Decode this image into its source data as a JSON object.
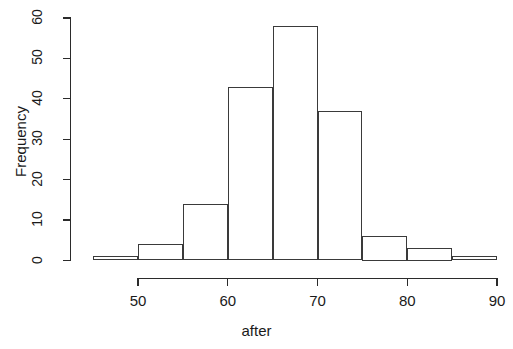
{
  "chart_data": {
    "type": "bar",
    "title": "",
    "xlabel": "after",
    "ylabel": "Frequency",
    "bin_width": 5,
    "bin_edges": [
      45,
      50,
      55,
      60,
      65,
      70,
      75,
      80,
      85,
      90
    ],
    "categories": [
      "45-50",
      "50-55",
      "55-60",
      "60-65",
      "65-70",
      "70-75",
      "75-80",
      "80-85",
      "85-90"
    ],
    "values": [
      1,
      4,
      14,
      43,
      58,
      37,
      6,
      3,
      1
    ],
    "xlim": [
      45,
      90
    ],
    "ylim": [
      0,
      60
    ],
    "xticks": [
      50,
      60,
      70,
      80,
      90
    ],
    "xtick_labels": [
      "50",
      "60",
      "70",
      "80",
      "90"
    ],
    "yticks": [
      0,
      10,
      20,
      30,
      40,
      50,
      60
    ],
    "ytick_labels": [
      "0",
      "10",
      "20",
      "30",
      "40",
      "50",
      "60"
    ],
    "grid": false,
    "legend": false,
    "bar_fill": "#ffffff",
    "bar_stroke": "#3a3a3a",
    "background": "#ffffff"
  }
}
